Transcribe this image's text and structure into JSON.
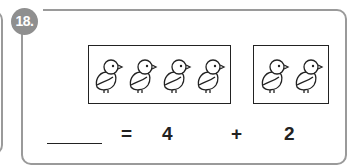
{
  "problem": {
    "number": "18.",
    "groups": [
      {
        "name": "left-group",
        "count": 4,
        "item": "chick-icon"
      },
      {
        "name": "right-group",
        "count": 2,
        "item": "chick-icon"
      }
    ],
    "equation": {
      "answer_blank": "",
      "equals": "=",
      "addend1": "4",
      "plus": "+",
      "addend2": "2"
    }
  },
  "colors": {
    "frame": "#9a9a9a",
    "badge": "#8f8f8f",
    "ink": "#222222"
  }
}
